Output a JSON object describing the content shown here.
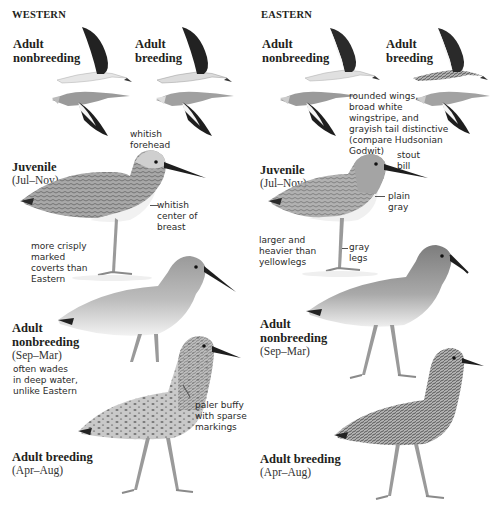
{
  "page": {
    "background": "#ffffff",
    "text_color": "#231f20"
  },
  "western": {
    "heading": "WESTERN",
    "flight": {
      "nonbreeding_label": [
        "Adult",
        "nonbreeding"
      ],
      "breeding_label": [
        "Adult",
        "breeding"
      ]
    },
    "juvenile": {
      "label": "Juvenile",
      "season": "(Jul–Nov)",
      "notes": {
        "forehead": [
          "whitish",
          "forehead"
        ],
        "breast": [
          "whitish",
          "center of",
          "breast"
        ],
        "coverts": [
          "more crisply",
          "marked",
          "coverts than",
          "Eastern"
        ]
      }
    },
    "adult_nonbreeding": {
      "label": [
        "Adult",
        "nonbreeding"
      ],
      "season": "(Sep–Mar)",
      "notes": {
        "wades": [
          "often wades",
          "in deep water,",
          "unlike Eastern"
        ]
      }
    },
    "adult_breeding": {
      "label": "Adult breeding",
      "season": "(Apr–Aug)",
      "notes": {
        "markings": [
          "paler buffy",
          "with sparse",
          "markings"
        ]
      }
    }
  },
  "eastern": {
    "heading": "EASTERN",
    "flight": {
      "nonbreeding_label": [
        "Adult",
        "nonbreeding"
      ],
      "breeding_label": [
        "Adult",
        "breeding"
      ],
      "wing_note": [
        "rounded wings,",
        "broad white",
        "wingstripe, and",
        "grayish tail distinctive",
        "(compare Hudsonian",
        "Godwit)"
      ]
    },
    "juvenile": {
      "label": "Juvenile",
      "season": "(Jul–Nov)",
      "notes": {
        "bill": [
          "stout",
          "bill"
        ],
        "breast": [
          "plain",
          "gray"
        ],
        "size": [
          "larger and",
          "heavier than",
          "yellowlegs"
        ],
        "legs": [
          "gray",
          "legs"
        ]
      }
    },
    "adult_nonbreeding": {
      "label": [
        "Adult",
        "nonbreeding"
      ],
      "season": "(Sep–Mar)"
    },
    "adult_breeding": {
      "label": "Adult breeding",
      "season": "(Apr–Aug)"
    }
  }
}
